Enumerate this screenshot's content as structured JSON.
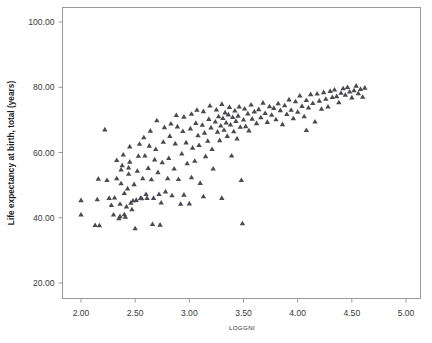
{
  "chart_data": {
    "type": "scatter",
    "title": "",
    "xlabel": "LOGGNI",
    "ylabel": "Life expectancy at birth, total (years)",
    "xlim": [
      1.85,
      5.15
    ],
    "ylim": [
      16.0,
      104.0
    ],
    "xticks": [
      2.0,
      2.5,
      3.0,
      3.5,
      4.0,
      4.5,
      5.0
    ],
    "xtick_labels": [
      "2.00",
      "2.50",
      "3.00",
      "3.50",
      "4.00",
      "4.50",
      "5.00"
    ],
    "yticks": [
      20.0,
      40.0,
      60.0,
      80.0,
      100.0
    ],
    "ytick_labels": [
      "20.00",
      "40.00",
      "60.00",
      "80.00",
      "100.00"
    ],
    "grid": false,
    "legend": null,
    "marker": "triangle",
    "marker_color": "#4a4a52",
    "frame_color": "#9a9a9a",
    "n_points": 180,
    "points": [
      [
        2.0,
        45.3
      ],
      [
        2.0,
        40.9
      ],
      [
        2.13,
        37.7
      ],
      [
        2.17,
        37.6
      ],
      [
        2.15,
        45.6
      ],
      [
        2.16,
        51.9
      ],
      [
        2.22,
        67.0
      ],
      [
        2.24,
        51.5
      ],
      [
        2.26,
        46.0
      ],
      [
        2.28,
        43.8
      ],
      [
        2.3,
        40.9
      ],
      [
        2.31,
        46.1
      ],
      [
        2.33,
        52.0
      ],
      [
        2.33,
        57.6
      ],
      [
        2.35,
        39.8
      ],
      [
        2.36,
        40.4
      ],
      [
        2.36,
        44.2
      ],
      [
        2.37,
        50.5
      ],
      [
        2.37,
        54.7
      ],
      [
        2.38,
        56.0
      ],
      [
        2.39,
        59.3
      ],
      [
        2.4,
        47.5
      ],
      [
        2.4,
        41.0
      ],
      [
        2.41,
        40.2
      ],
      [
        2.42,
        43.4
      ],
      [
        2.43,
        48.9
      ],
      [
        2.44,
        53.4
      ],
      [
        2.44,
        55.3
      ],
      [
        2.45,
        57.1
      ],
      [
        2.45,
        61.8
      ],
      [
        2.46,
        44.5
      ],
      [
        2.47,
        42.5
      ],
      [
        2.48,
        45.2
      ],
      [
        2.49,
        50.2
      ],
      [
        2.5,
        36.7
      ],
      [
        2.51,
        45.4
      ],
      [
        2.52,
        54.3
      ],
      [
        2.53,
        58.9
      ],
      [
        2.54,
        62.6
      ],
      [
        2.55,
        46.0
      ],
      [
        2.56,
        45.9
      ],
      [
        2.57,
        52.0
      ],
      [
        2.58,
        64.6
      ],
      [
        2.59,
        59.0
      ],
      [
        2.6,
        47.2
      ],
      [
        2.61,
        46.0
      ],
      [
        2.62,
        55.2
      ],
      [
        2.63,
        62.0
      ],
      [
        2.64,
        66.6
      ],
      [
        2.65,
        51.7
      ],
      [
        2.66,
        38.0
      ],
      [
        2.67,
        46.0
      ],
      [
        2.68,
        57.8
      ],
      [
        2.69,
        61.0
      ],
      [
        2.7,
        69.8
      ],
      [
        2.71,
        53.9
      ],
      [
        2.72,
        47.2
      ],
      [
        2.73,
        37.8
      ],
      [
        2.74,
        44.6
      ],
      [
        2.75,
        56.9
      ],
      [
        2.76,
        63.2
      ],
      [
        2.77,
        67.7
      ],
      [
        2.78,
        48.0
      ],
      [
        2.8,
        52.0
      ],
      [
        2.81,
        58.2
      ],
      [
        2.82,
        65.0
      ],
      [
        2.83,
        68.8
      ],
      [
        2.84,
        46.8
      ],
      [
        2.86,
        55.0
      ],
      [
        2.87,
        62.7
      ],
      [
        2.88,
        71.4
      ],
      [
        2.89,
        67.9
      ],
      [
        2.9,
        51.8
      ],
      [
        2.92,
        44.2
      ],
      [
        2.93,
        59.6
      ],
      [
        2.94,
        66.5
      ],
      [
        2.95,
        70.9
      ],
      [
        2.97,
        63.0
      ],
      [
        2.98,
        56.6
      ],
      [
        3.0,
        44.3
      ],
      [
        3.01,
        67.3
      ],
      [
        3.02,
        71.8
      ],
      [
        3.03,
        61.4
      ],
      [
        3.05,
        57.4
      ],
      [
        3.06,
        69.0
      ],
      [
        3.07,
        73.0
      ],
      [
        3.08,
        65.2
      ],
      [
        3.09,
        62.2
      ],
      [
        3.1,
        50.6
      ],
      [
        3.12,
        68.4
      ],
      [
        3.13,
        72.6
      ],
      [
        3.14,
        66.0
      ],
      [
        3.15,
        58.8
      ],
      [
        3.17,
        63.5
      ],
      [
        3.18,
        70.2
      ],
      [
        3.19,
        74.3
      ],
      [
        3.2,
        67.6
      ],
      [
        3.21,
        61.0
      ],
      [
        3.22,
        55.0
      ],
      [
        3.24,
        69.4
      ],
      [
        3.25,
        73.1
      ],
      [
        3.26,
        66.3
      ],
      [
        3.27,
        71.0
      ],
      [
        3.28,
        63.7
      ],
      [
        3.29,
        68.2
      ],
      [
        3.3,
        74.8
      ],
      [
        3.31,
        70.5
      ],
      [
        3.32,
        66.9
      ],
      [
        3.33,
        72.2
      ],
      [
        3.34,
        69.1
      ],
      [
        3.35,
        65.0
      ],
      [
        3.36,
        71.6
      ],
      [
        3.37,
        73.9
      ],
      [
        3.38,
        68.5
      ],
      [
        3.39,
        59.0
      ],
      [
        3.4,
        70.8
      ],
      [
        3.41,
        66.4
      ],
      [
        3.42,
        72.8
      ],
      [
        3.43,
        69.6
      ],
      [
        3.44,
        64.2
      ],
      [
        3.45,
        71.2
      ],
      [
        3.46,
        74.0
      ],
      [
        3.47,
        67.8
      ],
      [
        3.48,
        51.5
      ],
      [
        3.49,
        38.2
      ],
      [
        3.5,
        70.0
      ],
      [
        3.51,
        73.4
      ],
      [
        3.52,
        68.0
      ],
      [
        3.54,
        71.9
      ],
      [
        3.55,
        66.7
      ],
      [
        3.57,
        74.6
      ],
      [
        3.58,
        70.3
      ],
      [
        3.6,
        72.5
      ],
      [
        3.62,
        68.9
      ],
      [
        3.64,
        73.2
      ],
      [
        3.66,
        70.7
      ],
      [
        3.68,
        75.2
      ],
      [
        3.7,
        72.0
      ],
      [
        3.72,
        69.3
      ],
      [
        3.74,
        74.1
      ],
      [
        3.76,
        71.5
      ],
      [
        3.78,
        73.6
      ],
      [
        3.8,
        70.1
      ],
      [
        3.82,
        75.0
      ],
      [
        3.84,
        72.9
      ],
      [
        3.86,
        68.6
      ],
      [
        3.88,
        74.4
      ],
      [
        3.9,
        71.7
      ],
      [
        3.92,
        76.2
      ],
      [
        3.94,
        73.0
      ],
      [
        3.96,
        70.4
      ],
      [
        3.98,
        75.6
      ],
      [
        4.0,
        72.4
      ],
      [
        4.02,
        77.4
      ],
      [
        4.04,
        74.2
      ],
      [
        4.06,
        71.0
      ],
      [
        4.08,
        76.0
      ],
      [
        4.1,
        73.7
      ],
      [
        4.12,
        77.8
      ],
      [
        4.14,
        75.1
      ],
      [
        4.16,
        69.4
      ],
      [
        4.18,
        78.0
      ],
      [
        4.2,
        75.8
      ],
      [
        4.22,
        73.3
      ],
      [
        4.24,
        78.4
      ],
      [
        4.26,
        76.4
      ],
      [
        4.28,
        74.0
      ],
      [
        4.3,
        78.8
      ],
      [
        4.32,
        76.9
      ],
      [
        4.34,
        79.2
      ],
      [
        4.36,
        77.2
      ],
      [
        4.38,
        75.3
      ],
      [
        4.4,
        78.2
      ],
      [
        4.42,
        79.6
      ],
      [
        4.44,
        77.6
      ],
      [
        4.46,
        80.0
      ],
      [
        4.48,
        78.6
      ],
      [
        4.5,
        76.8
      ],
      [
        4.52,
        79.0
      ],
      [
        4.54,
        80.4
      ],
      [
        4.56,
        78.1
      ],
      [
        4.58,
        79.4
      ],
      [
        4.6,
        77.0
      ],
      [
        4.62,
        79.8
      ],
      [
        4.08,
        66.8
      ],
      [
        3.13,
        46.5
      ],
      [
        3.3,
        46.0
      ],
      [
        2.95,
        47.0
      ],
      [
        3.02,
        52.3
      ]
    ]
  },
  "axes": {
    "x_axis_name": "LOGGNI",
    "y_axis_name": "Life expectancy at birth, total (years)"
  }
}
